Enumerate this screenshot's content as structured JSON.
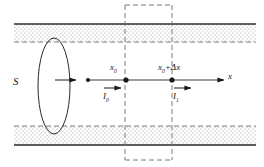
{
  "figure": {
    "type": "physics-diagram",
    "width": 264,
    "height": 167,
    "background": "#ffffff",
    "ink_color": "#1a1a1a",
    "stipple_color": "#8c8c8c"
  },
  "labels": {
    "surface": "S",
    "point_left": "x",
    "point_left_sub": "0",
    "point_right": "x",
    "point_right_sub": "0",
    "point_right_tail": "+Δx",
    "axis": "x",
    "current_left": "I",
    "current_left_sub": "0",
    "current_right": "I",
    "current_right_sub": "1"
  },
  "geometry": {
    "tube_top_solid_y": 24,
    "tube_top_dashed_y": 42,
    "tube_bottom_dashed_y": 126,
    "tube_bottom_solid_y": 145,
    "axis_y": 80,
    "axis_start_x": 88,
    "axis_end_x": 228,
    "ellipse_cx": 54,
    "ellipse_cy": 86,
    "ellipse_rx": 16,
    "ellipse_ry": 48,
    "control_box_left": 125,
    "control_box_right": 172,
    "control_box_top": 5,
    "control_box_bottom": 160,
    "dot_origin_x": 88,
    "dot_x0_x": 126,
    "dot_x1_x": 172
  },
  "annotations": {
    "flow_arrow_start_x": 55,
    "flow_arrow_end_x": 80,
    "current_left_arrow_start_x": 104,
    "current_left_arrow_end_x": 124,
    "current_right_arrow_start_x": 174,
    "current_right_arrow_end_x": 194
  }
}
